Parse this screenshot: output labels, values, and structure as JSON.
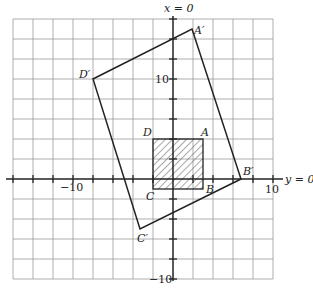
{
  "diagram": {
    "axes": {
      "vertical_label": "x = 0",
      "horizontal_label": "y = 0",
      "tick_labels": {
        "x_neg": "−10",
        "x_pos": "10",
        "y_pos": "10",
        "y_neg": "−10"
      }
    },
    "original_square": {
      "vertices": [
        {
          "name": "A",
          "x": 3,
          "y": 4
        },
        {
          "name": "B",
          "x": 3,
          "y": -1
        },
        {
          "name": "C",
          "x": -2,
          "y": -1
        },
        {
          "name": "D",
          "x": -2,
          "y": 4
        }
      ],
      "fill": "hatched"
    },
    "image_quadrilateral": {
      "vertices": [
        {
          "name": "A′",
          "x": 2,
          "y": 15
        },
        {
          "name": "B′",
          "x": 7,
          "y": 0
        },
        {
          "name": "C′",
          "x": -4,
          "y": -5
        },
        {
          "name": "D′",
          "x": -9,
          "y": 10
        }
      ]
    },
    "labels": {
      "A": "A",
      "B": "B",
      "C": "C",
      "D": "D",
      "A_prime": "A′",
      "B_prime": "B′",
      "C_prime": "C′",
      "D_prime": "D′"
    }
  }
}
